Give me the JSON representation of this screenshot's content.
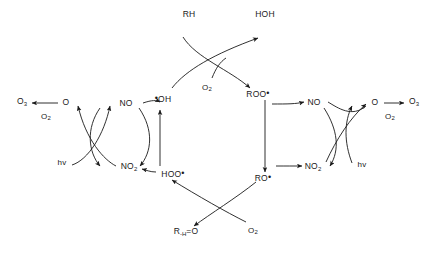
{
  "diagram": {
    "type": "reaction-cycle-diagram",
    "background_color": "#ffffff",
    "stroke_color": "#1a1a1a",
    "text_color": "#1a1a1a",
    "species": {
      "ozone_left": "O",
      "ozone_left_sub": "3",
      "oxygen_left_label": "O",
      "oxygen_left_sub": "2",
      "atomic_oxygen_left": "O",
      "nitric_oxide_left": "NO",
      "nitrogen_dioxide_left": "NO",
      "nitrogen_dioxide_left_sub": "2",
      "photon_left": "hv",
      "hydroxyl_radical": "OH",
      "hydroperoxy_radical": "HOO",
      "alkane": "RH",
      "water": "HOH",
      "oxygen_top": "O",
      "oxygen_top_sub": "2",
      "peroxy_radical": "ROO",
      "alkoxy_radical": "RO",
      "carbonyl_product": "R",
      "carbonyl_product_sub": "-H",
      "carbonyl_product_tail": "=O",
      "oxygen_bottom": "O",
      "oxygen_bottom_sub": "2",
      "nitric_oxide_right": "NO",
      "nitrogen_dioxide_right": "NO",
      "nitrogen_dioxide_right_sub": "2",
      "atomic_oxygen_right": "O",
      "oxygen_right_label": "O",
      "oxygen_right_sub": "2",
      "ozone_right": "O",
      "ozone_right_sub": "3",
      "photon_right": "hv",
      "radical_dot": "•"
    }
  }
}
